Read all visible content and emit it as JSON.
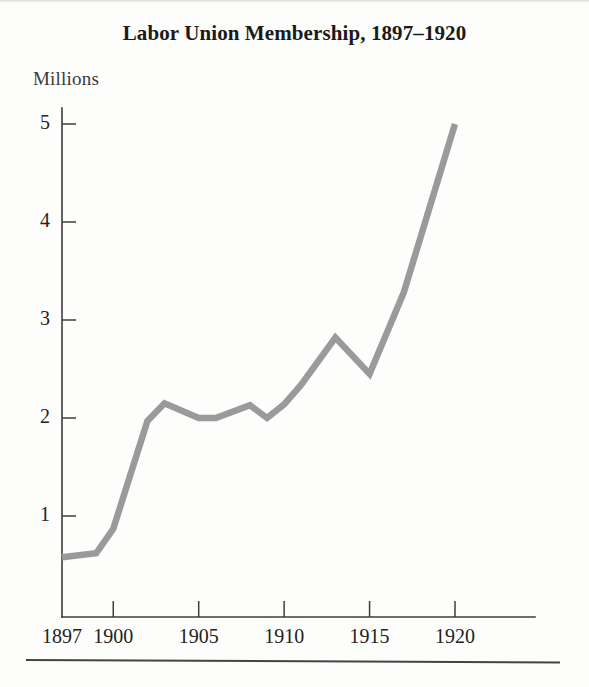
{
  "figure": {
    "title": "Labor Union Membership, 1897–1920",
    "y_axis_caption": "Millions",
    "source_note": "Source: U.S. Bureau of the Census",
    "background_color": "#fdfdfc",
    "line_color": "#9a9a9a",
    "axis_color": "#3c3c3c",
    "text_color": "#1a1a1a"
  },
  "chart_data": {
    "type": "line",
    "title": "Labor Union Membership, 1897–1920",
    "subtitle": "",
    "xlabel": "",
    "ylabel": "Millions",
    "xlim": [
      1897,
      1922.5
    ],
    "ylim": [
      0,
      5.4
    ],
    "grid": false,
    "legend": false,
    "x_tick_labels": [
      "1897",
      "1900",
      "1905",
      "1910",
      "1915",
      "1920"
    ],
    "x_ticks": [
      1897,
      1900,
      1905,
      1910,
      1915,
      1920
    ],
    "y_tick_labels": [
      "1",
      "2",
      "3",
      "4",
      "5"
    ],
    "y_ticks": [
      1,
      2,
      3,
      4,
      5
    ],
    "series": [
      {
        "name": "Labor union membership",
        "color": "#9a9a9a",
        "x": [
          1897,
          1899,
          1900,
          1902,
          1903,
          1905,
          1906,
          1908,
          1909,
          1910,
          1911,
          1913,
          1915,
          1917,
          1920
        ],
        "values": [
          0.58,
          0.62,
          0.87,
          1.97,
          2.15,
          2.0,
          2.0,
          2.13,
          2.0,
          2.14,
          2.34,
          2.82,
          2.45,
          3.28,
          5.0
        ]
      }
    ]
  }
}
